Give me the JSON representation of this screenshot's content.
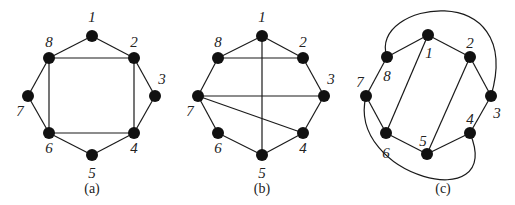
{
  "panels": [
    {
      "id": "a",
      "caption": "(a)",
      "nodes": [
        "1",
        "2",
        "3",
        "4",
        "5",
        "6",
        "7",
        "8"
      ],
      "edges": [
        [
          "1",
          "2"
        ],
        [
          "2",
          "3"
        ],
        [
          "3",
          "4"
        ],
        [
          "4",
          "5"
        ],
        [
          "5",
          "6"
        ],
        [
          "6",
          "7"
        ],
        [
          "7",
          "8"
        ],
        [
          "8",
          "1"
        ],
        [
          "8",
          "2"
        ],
        [
          "2",
          "4"
        ],
        [
          "4",
          "6"
        ],
        [
          "6",
          "8"
        ]
      ],
      "curved_edges": []
    },
    {
      "id": "b",
      "caption": "(b)",
      "nodes": [
        "1",
        "2",
        "3",
        "4",
        "5",
        "6",
        "7",
        "8"
      ],
      "edges": [
        [
          "1",
          "2"
        ],
        [
          "2",
          "3"
        ],
        [
          "3",
          "4"
        ],
        [
          "4",
          "5"
        ],
        [
          "5",
          "6"
        ],
        [
          "6",
          "7"
        ],
        [
          "7",
          "8"
        ],
        [
          "8",
          "1"
        ],
        [
          "8",
          "2"
        ],
        [
          "1",
          "5"
        ],
        [
          "7",
          "3"
        ],
        [
          "7",
          "4"
        ]
      ],
      "curved_edges": []
    },
    {
      "id": "c",
      "caption": "(c)",
      "nodes": [
        "1",
        "2",
        "3",
        "4",
        "5",
        "6",
        "7",
        "8"
      ],
      "edges": [
        [
          "1",
          "8"
        ],
        [
          "1",
          "2"
        ],
        [
          "2",
          "3"
        ],
        [
          "8",
          "7"
        ],
        [
          "7",
          "6"
        ],
        [
          "6",
          "5"
        ],
        [
          "5",
          "4"
        ],
        [
          "4",
          "3"
        ],
        [
          "1",
          "6"
        ],
        [
          "2",
          "5"
        ]
      ],
      "curved_edges": [
        [
          "8",
          "3"
        ],
        [
          "7",
          "4"
        ]
      ]
    }
  ],
  "style": {
    "node_color": "#111111",
    "edge_color": "#1a1a1a"
  }
}
